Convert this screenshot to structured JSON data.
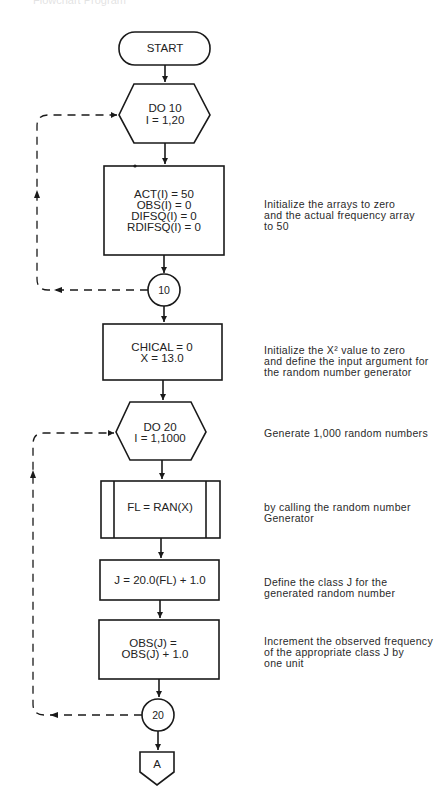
{
  "header": {
    "cut_off_title": "Flowchart Program"
  },
  "nodes": {
    "start": {
      "label": "START"
    },
    "do10": {
      "line1": "DO 10",
      "line2": "I = 1,20"
    },
    "init_arrays": {
      "lines": [
        "ACT(I) = 50",
        "OBS(I) = 0",
        "DIFSQ(I) = 0",
        "RDIFSQ(I) = 0"
      ]
    },
    "connector10": {
      "label": "10"
    },
    "init_chical": {
      "line1": "CHICAL = 0",
      "line2": "X = 13.0"
    },
    "do20": {
      "line1": "DO 20",
      "line2": "I = 1,1000"
    },
    "call_ran": {
      "label": "FL = RAN(X)"
    },
    "class_j": {
      "label": "J = 20.0(FL) + 1.0"
    },
    "increment_obs": {
      "line1": "OBS(J) =",
      "line2": "OBS(J) + 1.0"
    },
    "connector20": {
      "label": "20"
    },
    "offpage_a": {
      "label": "A"
    }
  },
  "notes": {
    "init_arrays": "Initialize the arrays to zero\nand the actual frequency array\nto 50",
    "init_chical": "Initialize the X² value to zero\nand define the input argument for\nthe random number generator",
    "do20": "Generate 1,000 random numbers",
    "call_ran": "by calling the random number\nGenerator",
    "class_j": "Define the class J for the\ngenerated random number",
    "increment_obs": "Increment the observed frequency\nof the appropriate class J by\none unit"
  },
  "colors": {
    "line": "#1a1a1a",
    "text": "#222222",
    "background": "#ffffff"
  }
}
